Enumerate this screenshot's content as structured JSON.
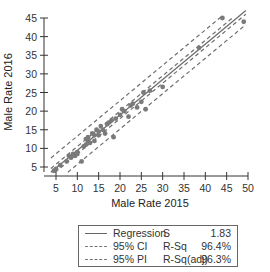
{
  "chart_data": {
    "type": "scatter",
    "title": "",
    "xlabel": "Male Rate 2015",
    "ylabel": "Male Rate 2016",
    "xlim": [
      3.5,
      50
    ],
    "ylim": [
      3.5,
      45
    ],
    "x_ticks": [
      5,
      10,
      15,
      20,
      25,
      30,
      35,
      40,
      45,
      50
    ],
    "y_ticks": [
      5,
      10,
      15,
      20,
      25,
      30,
      35,
      40,
      45
    ],
    "grid": false,
    "legend_position": "below",
    "points": [
      [
        4.5,
        4.0
      ],
      [
        5.0,
        4.5
      ],
      [
        6.0,
        5.5
      ],
      [
        7.5,
        6.5
      ],
      [
        8.0,
        8.0
      ],
      [
        8.5,
        7.5
      ],
      [
        9.0,
        8.5
      ],
      [
        9.5,
        8.0
      ],
      [
        10.0,
        8.5
      ],
      [
        10.0,
        9.0
      ],
      [
        11.0,
        6.5
      ],
      [
        11.5,
        10.5
      ],
      [
        12.0,
        11.0
      ],
      [
        12.0,
        12.5
      ],
      [
        12.5,
        12.0
      ],
      [
        12.5,
        13.0
      ],
      [
        13.0,
        11.5
      ],
      [
        13.5,
        14.0
      ],
      [
        14.0,
        12.0
      ],
      [
        14.0,
        13.5
      ],
      [
        14.5,
        15.0
      ],
      [
        15.0,
        13.5
      ],
      [
        15.0,
        14.5
      ],
      [
        15.5,
        16.0
      ],
      [
        16.0,
        15.0
      ],
      [
        16.5,
        14.0
      ],
      [
        17.0,
        16.5
      ],
      [
        17.5,
        17.0
      ],
      [
        18.0,
        17.5
      ],
      [
        18.5,
        13.0
      ],
      [
        19.0,
        18.0
      ],
      [
        20.0,
        19.0
      ],
      [
        20.5,
        20.5
      ],
      [
        21.0,
        20.0
      ],
      [
        22.0,
        18.5
      ],
      [
        22.5,
        21.5
      ],
      [
        23.0,
        22.0
      ],
      [
        24.0,
        21.0
      ],
      [
        25.0,
        22.5
      ],
      [
        25.5,
        25.0
      ],
      [
        26.0,
        20.5
      ],
      [
        27.0,
        25.5
      ],
      [
        30.0,
        26.5
      ],
      [
        38.5,
        37.0
      ],
      [
        44.0,
        45.0
      ],
      [
        49.0,
        44.0
      ]
    ],
    "regression": {
      "intercept": 0.0,
      "slope": 0.95,
      "S": 1.83,
      "R_Sq": "96.4%",
      "R_Sq_adj": "96.3%"
    },
    "ci_halfwidth": 1.0,
    "pi_halfwidth": 3.8,
    "legend": [
      {
        "label": "Regression",
        "style": "solid"
      },
      {
        "label": "95% CI",
        "style": "dashed"
      },
      {
        "label": "95% PI",
        "style": "dashed"
      }
    ]
  },
  "legend": {
    "rows": [
      {
        "label": "Regression",
        "stat": "S",
        "value": "1.83"
      },
      {
        "label": "95% CI",
        "stat": "R-Sq",
        "value": "96.4%"
      },
      {
        "label": "95% PI",
        "stat": "R-Sq(adj)",
        "value": "96.3%"
      }
    ]
  },
  "colors": {
    "points": "#7a7a7a",
    "lines": "#6e6e6e",
    "axis": "#333333"
  }
}
